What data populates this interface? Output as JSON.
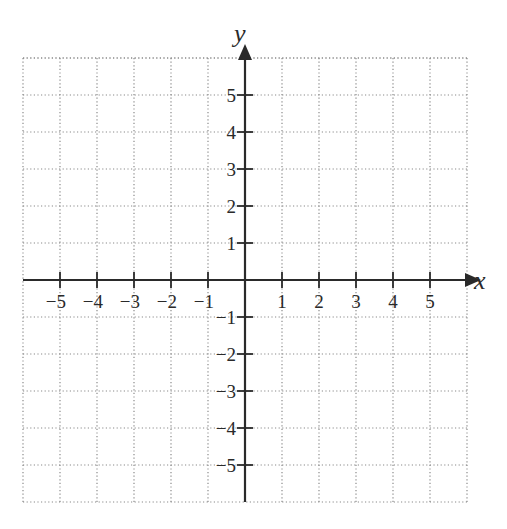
{
  "chart_data": {
    "type": "coordinate-plane",
    "title": "",
    "xlabel": "x",
    "ylabel": "y",
    "xlim": [
      -6,
      6
    ],
    "ylim": [
      -6,
      6
    ],
    "grid": true,
    "grid_style": "dotted",
    "x_ticks": [
      -5,
      -4,
      -3,
      -2,
      -1,
      1,
      2,
      3,
      4,
      5
    ],
    "y_ticks": [
      -5,
      -4,
      -3,
      -2,
      -1,
      1,
      2,
      3,
      4,
      5
    ],
    "x_tick_labels": [
      "−5",
      "−4",
      "−3",
      "−2",
      "−1",
      "1",
      "2",
      "3",
      "4",
      "5"
    ],
    "y_tick_labels": [
      "−5",
      "−4",
      "−3",
      "−2",
      "−1",
      "1",
      "2",
      "3",
      "4",
      "5"
    ],
    "series": []
  },
  "layout": {
    "origin_px": [
      245,
      280
    ],
    "unit_px": 37,
    "grid_color": "#8a8a8a",
    "axis_color": "#2a2a2a"
  }
}
